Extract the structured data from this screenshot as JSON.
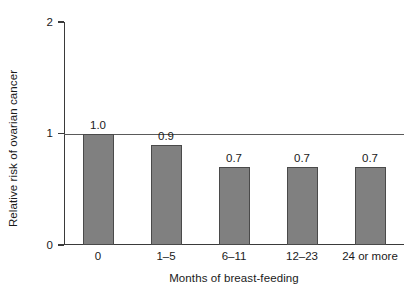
{
  "chart_data": {
    "type": "bar",
    "title": "",
    "subtitle": "",
    "xlabel": "Months of breast-feeding",
    "ylabel": "Relative risk of ovarian cancer",
    "categories": [
      "0",
      "1–5",
      "6–11",
      "12–23",
      "24 or more"
    ],
    "values": [
      1.0,
      0.9,
      0.7,
      0.7,
      0.7
    ],
    "data_labels": [
      "1.0",
      "0.9",
      "0.7",
      "0.7",
      "0.7"
    ],
    "ylim": [
      0,
      2
    ],
    "yticks": [
      0,
      1,
      2
    ],
    "ytick_labels": [
      "0",
      "1",
      "2"
    ],
    "grid": false,
    "legend": null,
    "reference_line": {
      "value": 1.0,
      "label": "",
      "color": "#5a5a5a"
    },
    "colors": {
      "bar_fill": "#808080",
      "bar_edge": "#4a4a4a",
      "axis": "#3a3a3a",
      "text": "#1a1a1a",
      "background": "#ffffff"
    }
  }
}
